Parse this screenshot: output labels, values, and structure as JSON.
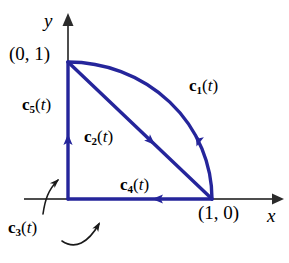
{
  "figure": {
    "background_color": "#ffffff",
    "axis_color": "#4d4d4d",
    "curve_color": "#25259b",
    "leader_color": "#1a1a1a",
    "text_color": "#000000",
    "axes": {
      "y_label": "y",
      "x_label": "x",
      "origin_px": [
        68,
        199
      ],
      "x_axis_end_px": [
        282,
        199
      ],
      "y_axis_end_px": [
        68,
        14
      ]
    },
    "points": [
      {
        "name": "point-0-1",
        "label": "(0, 1)",
        "px": [
          68,
          62
        ]
      },
      {
        "name": "point-1-0",
        "label": "(1, 0)",
        "px": [
          212,
          199
        ]
      }
    ],
    "curves": [
      {
        "name": "c1",
        "c": "c",
        "subscript": "1",
        "paren_open": "(",
        "t": "t",
        "paren_close": ")",
        "shape": "quarter-circle-arc",
        "from": "(0, 1)",
        "to": "(1, 0)",
        "direction": "clockwise toward (1, 0)",
        "arrow_mid": true
      },
      {
        "name": "c2",
        "c": "c",
        "subscript": "2",
        "paren_open": "(",
        "t": "t",
        "paren_close": ")",
        "shape": "straight-diagonal",
        "from": "(0, 1)",
        "to": "(1, 0)",
        "direction": "toward (1, 0)",
        "arrow_mid": true
      },
      {
        "name": "c3",
        "c": "c",
        "subscript": "3",
        "paren_open": "(",
        "t": "t",
        "paren_close": ")",
        "shape": "two-segment-path",
        "from": "(1, 0)",
        "to": "(0, 1)",
        "note": "labels both the horizontal and vertical segments via leader arrows"
      },
      {
        "name": "c4",
        "c": "c",
        "subscript": "4",
        "paren_open": "(",
        "t": "t",
        "paren_close": ")",
        "shape": "horizontal-segment",
        "from": "(1, 0)",
        "to": "(0, 0)",
        "direction": "leftward",
        "arrow_mid": true
      },
      {
        "name": "c5",
        "c": "c",
        "subscript": "5",
        "paren_open": "(",
        "t": "t",
        "paren_close": ")",
        "shape": "vertical-segment",
        "from": "(0, 0)",
        "to": "(0, 1)",
        "direction": "upward",
        "arrow_mid": true
      }
    ]
  }
}
